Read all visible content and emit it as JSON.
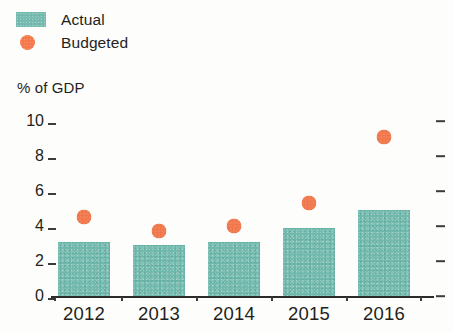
{
  "legend": {
    "items": [
      {
        "label": "Actual",
        "marker": "square",
        "color": "#6fb8ac",
        "icon": "teal-square-swatch"
      },
      {
        "label": "Budgeted",
        "marker": "circle",
        "color": "#f4794d",
        "icon": "orange-circle-swatch"
      }
    ]
  },
  "axis_title": "% of GDP",
  "chart_data": {
    "type": "bar",
    "title": "",
    "subtitle": "",
    "xlabel": "",
    "ylabel": "% of GDP",
    "categories": [
      "2012",
      "2013",
      "2014",
      "2015",
      "2016"
    ],
    "series": [
      {
        "name": "Actual",
        "type": "bar",
        "color": "#6fb8ac",
        "values": [
          3.1,
          2.9,
          3.1,
          3.9,
          4.9
        ]
      },
      {
        "name": "Budgeted",
        "type": "scatter",
        "color": "#f4794d",
        "values": [
          4.5,
          3.7,
          4.0,
          5.3,
          9.1
        ]
      }
    ],
    "ylim": [
      0,
      10
    ],
    "yticks": [
      "0",
      "2",
      "4",
      "6",
      "8",
      "10"
    ],
    "ytick_values": [
      0,
      2,
      4,
      6,
      8,
      10
    ],
    "grid": false,
    "legend_position": "top-left",
    "right_axis_ticks": [
      0,
      2,
      4,
      6,
      8,
      10
    ]
  }
}
